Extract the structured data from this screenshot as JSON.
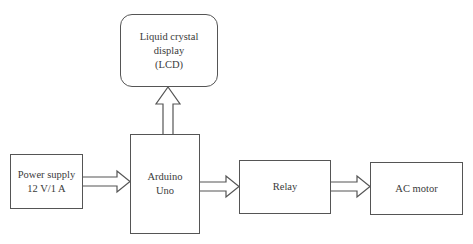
{
  "diagram": {
    "type": "block-diagram",
    "blocks": {
      "lcd": {
        "lines": [
          "Liquid crystal",
          "display",
          "(LCD)"
        ]
      },
      "power": {
        "lines": [
          "Power supply",
          "12 V/1 A"
        ]
      },
      "arduino": {
        "lines": [
          "Arduino",
          "Uno"
        ]
      },
      "relay": {
        "lines": [
          "Relay"
        ]
      },
      "motor": {
        "lines": [
          "AC motor"
        ]
      }
    },
    "connections": [
      {
        "from": "Power supply",
        "to": "Arduino Uno"
      },
      {
        "from": "Arduino Uno",
        "to": "Liquid crystal display (LCD)"
      },
      {
        "from": "Arduino Uno",
        "to": "Relay"
      },
      {
        "from": "Relay",
        "to": "AC motor"
      }
    ],
    "colors": {
      "stroke": "#555555",
      "text": "#3a3a3a",
      "background": "#ffffff"
    }
  }
}
